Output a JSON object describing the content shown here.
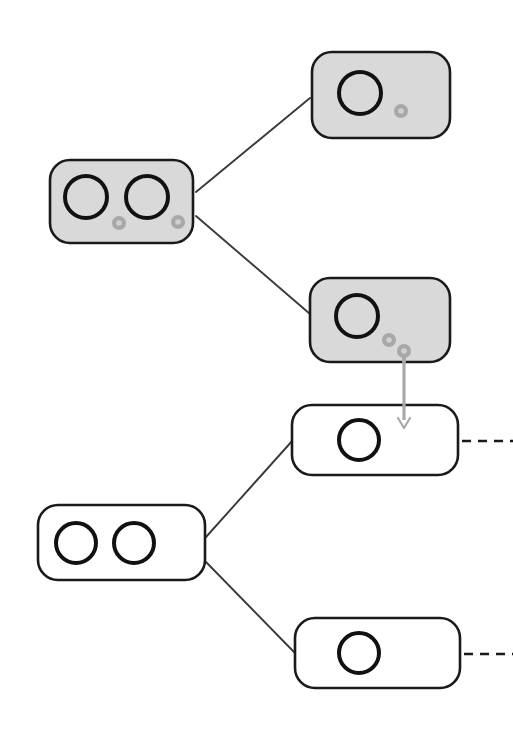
{
  "canvas": {
    "width": 513,
    "height": 742,
    "background": "#ffffff",
    "title": "Hierarchical node-pair matching diagram"
  },
  "style": {
    "node_stroke": "#1a1a1a",
    "node_stroke_width": 2.6,
    "shaded_fill": "#d9d9d9",
    "plain_fill": "#ffffff",
    "ring_stroke": "#111111",
    "ring_stroke_width": 4.0,
    "marker_fill": "#a8a8a8",
    "marker_hole_fill": "#d0d0d0",
    "edge_stroke": "#3a3a3a",
    "edge_stroke_width": 1.9,
    "arrow_stroke": "#a9a9a9",
    "arrow_stroke_width": 3.2,
    "dashed_stroke": "#1a1a1a",
    "dashed_stroke_width": 2.6,
    "dash_pattern": "9 7",
    "corner_radius": 20
  },
  "groups": [
    {
      "id": "shaded-group",
      "label": "shaded-tree",
      "shaded": true
    },
    {
      "id": "plain-group",
      "label": "plain-tree",
      "shaded": false
    }
  ],
  "nodes": [
    {
      "id": "shaded-parent",
      "name": "shaded-parent-node",
      "group": "shaded-group",
      "shaded": true,
      "x": 50,
      "y": 160,
      "width": 143,
      "height": 83,
      "rings": [
        {
          "cx": 86,
          "cy": 197,
          "r": 21
        },
        {
          "cx": 147,
          "cy": 197,
          "r": 21
        }
      ],
      "markers": [
        {
          "cx": 119,
          "cy": 223,
          "r": 7,
          "tail": false
        },
        {
          "cx": 178,
          "cy": 222,
          "r": 7,
          "tail": false
        }
      ]
    },
    {
      "id": "shaded-child-top",
      "name": "shaded-child-top-node",
      "group": "shaded-group",
      "shaded": true,
      "x": 312,
      "y": 52,
      "width": 138,
      "height": 86,
      "rings": [
        {
          "cx": 360,
          "cy": 93,
          "r": 21
        }
      ],
      "markers": [
        {
          "cx": 401,
          "cy": 111,
          "r": 7,
          "tail": false
        }
      ]
    },
    {
      "id": "shaded-child-bottom",
      "name": "shaded-child-bottom-node",
      "group": "shaded-group",
      "shaded": true,
      "x": 310,
      "y": 278,
      "width": 140,
      "height": 84,
      "rings": [
        {
          "cx": 357,
          "cy": 316,
          "r": 21
        }
      ],
      "markers": [
        {
          "cx": 389,
          "cy": 340,
          "r": 7,
          "tail": false
        },
        {
          "cx": 404,
          "cy": 351,
          "r": 7,
          "tail": true
        }
      ]
    },
    {
      "id": "plain-parent",
      "name": "plain-parent-node",
      "group": "plain-group",
      "shaded": false,
      "x": 38,
      "y": 505,
      "width": 167,
      "height": 75,
      "rings": [
        {
          "cx": 76,
          "cy": 543,
          "r": 20
        },
        {
          "cx": 134,
          "cy": 543,
          "r": 20
        }
      ],
      "markers": []
    },
    {
      "id": "plain-child-top",
      "name": "plain-child-top-node",
      "group": "plain-group",
      "shaded": false,
      "x": 292,
      "y": 405,
      "width": 166,
      "height": 70,
      "rings": [
        {
          "cx": 359,
          "cy": 440,
          "r": 20
        }
      ],
      "markers": []
    },
    {
      "id": "plain-child-bottom",
      "name": "plain-child-bottom-node",
      "group": "plain-group",
      "shaded": false,
      "x": 295,
      "y": 618,
      "width": 165,
      "height": 70,
      "rings": [
        {
          "cx": 359,
          "cy": 653,
          "r": 20
        }
      ],
      "markers": []
    }
  ],
  "edges": [
    {
      "id": "edge-shaded-top",
      "name": "edge-shaded-parent-to-top-child",
      "from": "shaded-parent",
      "to": "shaded-child-top",
      "x1": 196,
      "y1": 192,
      "x2": 310,
      "y2": 98,
      "kind": "solid"
    },
    {
      "id": "edge-shaded-bottom",
      "name": "edge-shaded-parent-to-bottom-child",
      "from": "shaded-parent",
      "to": "shaded-child-bottom",
      "x1": 196,
      "y1": 216,
      "x2": 310,
      "y2": 314,
      "kind": "solid"
    },
    {
      "id": "edge-plain-top",
      "name": "edge-plain-parent-to-top-child",
      "from": "plain-parent",
      "to": "plain-child-top",
      "x1": 206,
      "y1": 537,
      "x2": 293,
      "y2": 440,
      "kind": "solid"
    },
    {
      "id": "edge-plain-bottom",
      "name": "edge-plain-parent-to-bottom-child",
      "from": "plain-parent",
      "to": "plain-child-bottom",
      "x1": 206,
      "y1": 562,
      "x2": 294,
      "y2": 652,
      "kind": "solid"
    }
  ],
  "arrows": [
    {
      "id": "mapping-arrow",
      "name": "mapping-arrow-down",
      "from": "shaded-child-bottom",
      "to": "plain-child-top",
      "x": 404,
      "y1": 356,
      "y2": 428,
      "direction": "down"
    }
  ],
  "dashed_links": [
    {
      "id": "dashed-top",
      "name": "dashed-continuation-top",
      "from": "plain-child-top",
      "x1": 462,
      "x2": 513,
      "y": 441
    },
    {
      "id": "dashed-bottom",
      "name": "dashed-continuation-bottom",
      "from": "plain-child-bottom",
      "x1": 464,
      "x2": 513,
      "y": 654
    }
  ]
}
